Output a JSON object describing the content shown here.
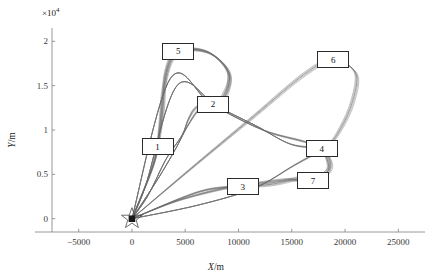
{
  "chart_data": {
    "type": "line",
    "title": "",
    "xlabel": "X/m",
    "ylabel": "Y/m",
    "y_exponent_label": "×10",
    "y_exponent_power": "4",
    "xlim": [
      -7500,
      27500
    ],
    "ylim": [
      -1500,
      21500
    ],
    "xticks": [
      -5000,
      0,
      5000,
      10000,
      15000,
      20000,
      25000
    ],
    "xtick_labels": [
      "−5000",
      "0",
      "5000",
      "10000",
      "15000",
      "20000",
      "25000"
    ],
    "yticks": [
      0,
      5000,
      10000,
      15000,
      20000
    ],
    "ytick_labels": [
      "0",
      "0.5",
      "1",
      "1.5",
      "2"
    ],
    "grid": false,
    "legend": "none",
    "line_color": "#6a6a6a",
    "marker_color": "#1a1a1a",
    "origin_marker": {
      "name": "base-station-star",
      "x": 0,
      "y": 0,
      "symbol": "star"
    },
    "waypoints": [
      {
        "id": "1",
        "x": 2400,
        "y": 8100
      },
      {
        "id": "2",
        "x": 7600,
        "y": 12900
      },
      {
        "id": "3",
        "x": 10400,
        "y": 3600
      },
      {
        "id": "4",
        "x": 17800,
        "y": 7900
      },
      {
        "id": "5",
        "x": 4350,
        "y": 18900
      },
      {
        "id": "6",
        "x": 18900,
        "y": 17900
      },
      {
        "id": "7",
        "x": 17000,
        "y": 4300
      }
    ],
    "series": [
      {
        "name": "route-bundle-a",
        "points": [
          [
            0,
            0
          ],
          [
            1700,
            5000
          ],
          [
            2400,
            8100
          ],
          [
            2900,
            12200
          ],
          [
            3200,
            16500
          ],
          [
            4350,
            18900
          ],
          [
            7200,
            18700
          ],
          [
            9100,
            16300
          ],
          [
            8600,
            13900
          ],
          [
            7600,
            12900
          ],
          [
            6100,
            12600
          ],
          [
            5300,
            11200
          ],
          [
            4700,
            9400
          ],
          [
            3200,
            6700
          ],
          [
            1500,
            2600
          ],
          [
            0,
            0
          ]
        ]
      },
      {
        "name": "route-bundle-b",
        "points": [
          [
            0,
            0
          ],
          [
            4200,
            2000
          ],
          [
            8600,
            3400
          ],
          [
            10400,
            3600
          ],
          [
            13200,
            3900
          ],
          [
            15900,
            4600
          ],
          [
            17000,
            4300
          ],
          [
            18400,
            5400
          ],
          [
            18200,
            7100
          ],
          [
            17800,
            7900
          ],
          [
            14900,
            8400
          ],
          [
            11600,
            10500
          ],
          [
            7300,
            13100
          ],
          [
            3600,
            15800
          ],
          [
            0,
            0
          ]
        ]
      },
      {
        "name": "route-bundle-c",
        "points": [
          [
            0,
            0
          ],
          [
            5400,
            5500
          ],
          [
            11400,
            11500
          ],
          [
            16200,
            16300
          ],
          [
            18900,
            17900
          ],
          [
            21000,
            16400
          ],
          [
            20700,
            13200
          ],
          [
            19600,
            10200
          ],
          [
            18300,
            8200
          ],
          [
            15200,
            6000
          ],
          [
            11400,
            3400
          ],
          [
            6100,
            1500
          ],
          [
            0,
            0
          ]
        ]
      },
      {
        "name": "route-bundle-d",
        "points": [
          [
            0,
            0
          ],
          [
            2100,
            6400
          ],
          [
            2600,
            10300
          ],
          [
            3000,
            14900
          ],
          [
            4100,
            18600
          ],
          [
            6900,
            18900
          ],
          [
            9000,
            16800
          ],
          [
            8900,
            14200
          ],
          [
            7900,
            12800
          ],
          [
            6400,
            12400
          ],
          [
            5200,
            10400
          ],
          [
            4200,
            8100
          ],
          [
            2500,
            4600
          ],
          [
            0,
            0
          ]
        ]
      },
      {
        "name": "route-bundle-e",
        "points": [
          [
            0,
            0
          ],
          [
            6200,
            3000
          ],
          [
            10100,
            3700
          ],
          [
            14600,
            4400
          ],
          [
            16800,
            4200
          ],
          [
            18600,
            5700
          ],
          [
            18100,
            7600
          ],
          [
            16400,
            8600
          ],
          [
            12500,
            9900
          ],
          [
            8200,
            12400
          ],
          [
            4300,
            15100
          ],
          [
            1300,
            3800
          ],
          [
            0,
            0
          ]
        ]
      }
    ]
  },
  "axes": {
    "exp_prefix": "×10",
    "exp_power": "4"
  }
}
